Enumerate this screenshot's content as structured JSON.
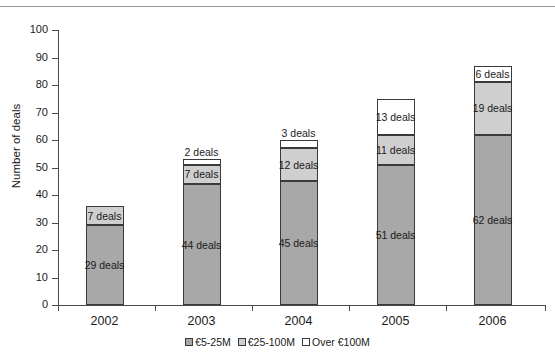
{
  "chart_data": {
    "type": "bar",
    "stacked": true,
    "title": "",
    "xlabel": "",
    "ylabel": "Number of deals",
    "categories": [
      "2002",
      "2003",
      "2004",
      "2005",
      "2006"
    ],
    "ylim": [
      0,
      100
    ],
    "ytick_labels": [
      "0",
      "10",
      "20",
      "30",
      "40",
      "50",
      "60",
      "70",
      "80",
      "90",
      "100"
    ],
    "ytick_values": [
      0,
      10,
      20,
      30,
      40,
      50,
      60,
      70,
      80,
      90,
      100
    ],
    "grid": false,
    "legend_position": "bottom",
    "series": [
      {
        "name": "€5-25M",
        "color": "#a8a8a8",
        "values": [
          29,
          44,
          45,
          51,
          62
        ],
        "labels": [
          "29 deals",
          "44 deals",
          "45 deals",
          "51 deals",
          "62 deals"
        ]
      },
      {
        "name": "€25-100M",
        "color": "#cfcfcf",
        "values": [
          7,
          7,
          12,
          11,
          19
        ],
        "labels": [
          "7 deals",
          "7 deals",
          "12 deals",
          "11 deals",
          "19 deals"
        ]
      },
      {
        "name": "Over €100M",
        "color": "#ffffff",
        "values": [
          0,
          2,
          3,
          13,
          6
        ],
        "labels": [
          "",
          "2 deals",
          "3 deals",
          "13 deals",
          "6 deals"
        ]
      }
    ],
    "totals": [
      36,
      53,
      60,
      75,
      87
    ]
  },
  "axis": {
    "y_title": "Number of deals"
  },
  "legend": {
    "items": [
      {
        "label": "€5-25M",
        "color": "#a8a8a8"
      },
      {
        "label": "€25-100M",
        "color": "#cfcfcf"
      },
      {
        "label": "Over €100M",
        "color": "#ffffff"
      }
    ]
  }
}
